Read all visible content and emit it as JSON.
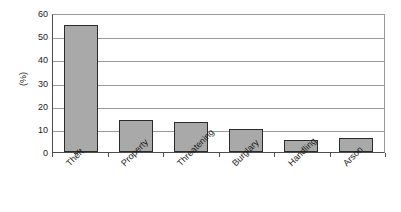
{
  "chart_data": {
    "type": "bar",
    "title": "",
    "subtitle": "",
    "xlabel": "",
    "ylabel": "(%)",
    "categories": [
      "Theft",
      "Property",
      "Threatening",
      "Burglary",
      "Handling",
      "Arson"
    ],
    "values": [
      55,
      14,
      13,
      10,
      5,
      6
    ],
    "ylim": [
      0,
      60
    ],
    "ytick_labels": [
      "60",
      "50",
      "40",
      "30",
      "20",
      "10",
      "0"
    ],
    "ytick_values": [
      60,
      50,
      40,
      30,
      20,
      10,
      0
    ],
    "ystep": 10,
    "grid": "horizontal",
    "legend": "none",
    "annotations": [],
    "series": [
      {
        "name": "Offence type",
        "values": [
          55,
          14,
          13,
          10,
          5,
          6
        ]
      }
    ],
    "colors": {
      "bar_fill": "#a9a9a9",
      "bar_border": "#2b2b2b",
      "gridline": "#9a9a9a",
      "axis": "#4d4d4d",
      "text": "#1a1a1a",
      "background": "#ffffff"
    }
  }
}
